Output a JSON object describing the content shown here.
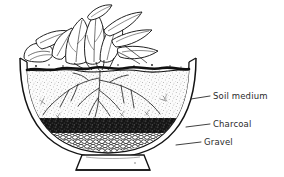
{
  "figure": {
    "background_color": "#ffffff",
    "ink_color": "#1a1a1a",
    "label_color": "#2b2b2b"
  },
  "labels": [
    {
      "id": "soil",
      "text": "Soil medium",
      "leader": {
        "x1": 191,
        "y1": 99,
        "x2": 210,
        "y2": 96
      }
    },
    {
      "id": "charcoal",
      "text": "Charcoal",
      "leader": {
        "x1": 186,
        "y1": 127,
        "x2": 210,
        "y2": 124
      }
    },
    {
      "id": "gravel",
      "text": "Gravel",
      "leader": {
        "x1": 176,
        "y1": 145,
        "x2": 201,
        "y2": 142
      }
    }
  ],
  "layers": [
    {
      "id": "soil",
      "name": "Soil medium",
      "fill": "#f2f2f2",
      "texture": "fine-stipple",
      "top_y": 70,
      "bottom_y": 118
    },
    {
      "id": "charcoal",
      "name": "Charcoal",
      "fill": "#1c1c1c",
      "texture": "coarse-black-granules",
      "top_y": 118,
      "bottom_y": 132
    },
    {
      "id": "gravel",
      "name": "Gravel",
      "fill": "#ffffff",
      "texture": "outlined-pebbles",
      "top_y": 132,
      "bottom_y": 155
    }
  ],
  "plant": {
    "name": "leafy-houseplant",
    "description": "broad-leaved foliage plant emerging from soil surface",
    "roots": "branching root system in soil medium"
  },
  "vessel": {
    "name": "shallow-bowl-planter",
    "rim_left_x": 20,
    "rim_right_x": 196,
    "rim_y": 58,
    "pedestal": {
      "top_y": 155,
      "bottom_y": 170,
      "top_width": 52,
      "bottom_width": 74
    }
  }
}
